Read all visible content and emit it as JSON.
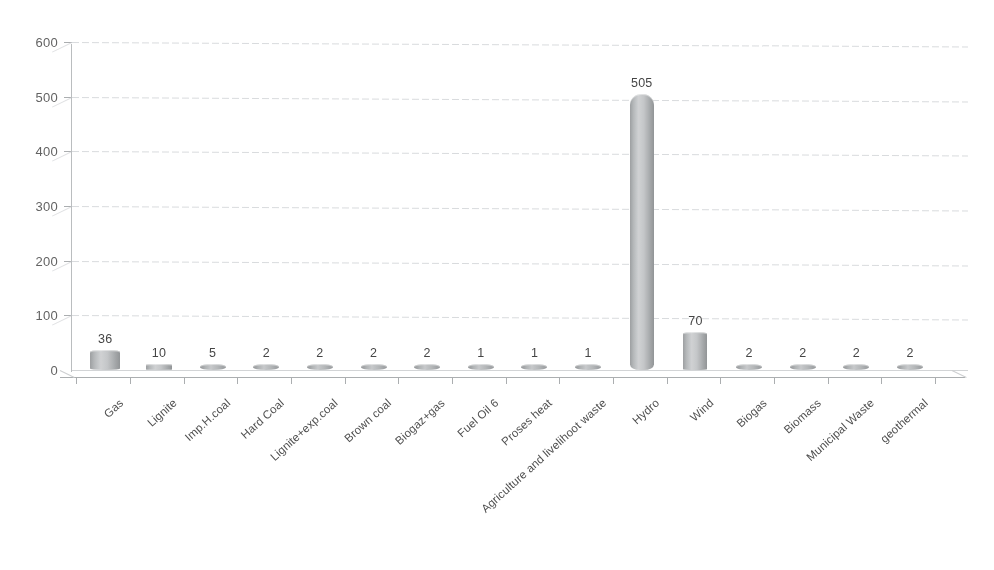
{
  "chart_data": {
    "type": "bar",
    "title": "",
    "xlabel": "",
    "ylabel": "",
    "ylim": [
      0,
      600
    ],
    "ytick_values": [
      0,
      100,
      200,
      300,
      400,
      500,
      600
    ],
    "ytick_labels": [
      "0",
      "100",
      "200",
      "300",
      "400",
      "500",
      "600"
    ],
    "grid": true,
    "legend": "none",
    "style": "3d-cylinder-bar",
    "bar_color": "#b6b9bb",
    "categories": [
      "Gas",
      "Lignite",
      "Imp.H.coal",
      "Hard Coal",
      "Lignite+exp.coal",
      "Brown coal",
      "Biogaz+gas",
      "Fuel Oil 6",
      "Proses heat",
      "Agriculture and livelihoot waste",
      "Hydro",
      "Wind",
      "Biogas",
      "Biomass",
      "Municipal Waste",
      "geothermal"
    ],
    "values": [
      36,
      10,
      5,
      2,
      2,
      2,
      2,
      1,
      1,
      1,
      505,
      70,
      2,
      2,
      2,
      2
    ],
    "data_labels": [
      "36",
      "10",
      "5",
      "2",
      "2",
      "2",
      "2",
      "1",
      "1",
      "1",
      "505",
      "70",
      "2",
      "2",
      "2",
      "2"
    ]
  }
}
